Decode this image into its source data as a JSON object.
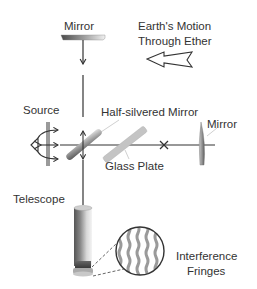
{
  "diagram": {
    "labels": {
      "top_mirror": "Mirror",
      "motion_line1": "Earth's Motion",
      "motion_line2": "Through Ether",
      "source": "Source",
      "half_silvered": "Half-silvered Mirror",
      "right_mirror": "Mirror",
      "glass_plate": "Glass Plate",
      "telescope": "Telescope",
      "fringes_line1": "Interference",
      "fringes_line2": "Fringes"
    },
    "colors": {
      "line": "#333333",
      "mirror_dark": "#555555",
      "mirror_light": "#e0e0e0",
      "glass": "#bbbbbb",
      "fringe": "#9a9a9a"
    }
  }
}
